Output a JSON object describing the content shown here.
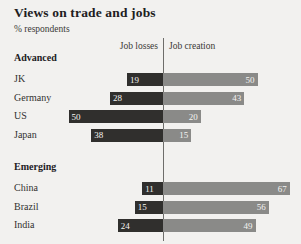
{
  "header": {
    "title": "Views on trade and jobs",
    "subtitle": "% respondents",
    "left_axis_label": "Job losses",
    "right_axis_label": "Job creation"
  },
  "colors": {
    "background": "#f2f1ef",
    "job_losses": "#302f2d",
    "job_creation": "#8a8a88",
    "axis": "#6e6d6a",
    "text": "#33322f",
    "value_text": "#f4f3f1"
  },
  "chart_data": {
    "type": "bar",
    "title": "Views on trade and jobs",
    "subtitle": "% respondents",
    "xlabel": "",
    "ylabel": "",
    "orientation": "horizontal",
    "layout": "diverging",
    "grid": false,
    "legend_position": "top-center",
    "xlim": [
      -60,
      80
    ],
    "units": "% respondents",
    "series": [
      {
        "name": "Job losses",
        "direction": "left",
        "color": "#302f2d",
        "values": [
          19,
          28,
          50,
          38,
          11,
          15,
          24
        ]
      },
      {
        "name": "Job creation",
        "direction": "right",
        "color": "#8a8a88",
        "values": [
          50,
          43,
          20,
          15,
          67,
          56,
          49
        ]
      }
    ],
    "categories": [
      "JK",
      "Germany",
      "US",
      "Japan",
      "China",
      "Brazil",
      "India"
    ],
    "groups": [
      {
        "label": "Advanced",
        "rows": [
          {
            "category": "JK",
            "job_losses": 19,
            "job_creation": 50
          },
          {
            "category": "Germany",
            "job_losses": 28,
            "job_creation": 43
          },
          {
            "category": "US",
            "job_losses": 50,
            "job_creation": 20
          },
          {
            "category": "Japan",
            "job_losses": 38,
            "job_creation": 15
          }
        ]
      },
      {
        "label": "Emerging",
        "rows": [
          {
            "category": "China",
            "job_losses": 11,
            "job_creation": 67
          },
          {
            "category": "Brazil",
            "job_losses": 15,
            "job_creation": 56
          },
          {
            "category": "India",
            "job_losses": 24,
            "job_creation": 49
          }
        ]
      }
    ]
  }
}
